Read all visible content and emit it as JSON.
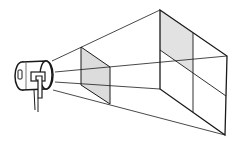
{
  "diagram": {
    "colors": {
      "line": "#1a1a1a",
      "shade": "#dcdcdc",
      "background": "#ffffff"
    },
    "projector": {
      "label": ""
    },
    "near_frame": {
      "shaded": true
    },
    "far_frame": {
      "grid": "2x2",
      "shaded_cell": "top-left"
    }
  }
}
